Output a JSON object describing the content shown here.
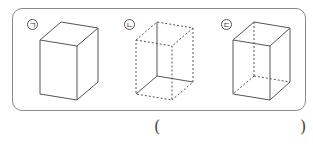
{
  "question": {
    "options": [
      {
        "label": "ㄱ",
        "description": "cube drawn with solid visible edges only"
      },
      {
        "label": "ㄴ",
        "description": "cube with dashed visible edges and solid hidden edges"
      },
      {
        "label": "ㄷ",
        "description": "cube with solid visible edges and dashed hidden edges"
      }
    ],
    "answer_open": "(",
    "answer_close": ")"
  },
  "colors": {
    "line": "#555555",
    "border": "#8a8a8a"
  }
}
